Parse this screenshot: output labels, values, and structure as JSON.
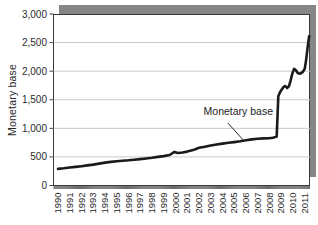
{
  "chart_data": {
    "type": "line",
    "title": "",
    "xlabel": "",
    "ylabel": "Monetary base",
    "ylim": [
      0,
      3000
    ],
    "xlim": [
      1989.62,
      2011.45
    ],
    "grid": "horizontal",
    "legend_position": "none",
    "y_ticks": [
      {
        "value": 0,
        "label": "0"
      },
      {
        "value": 500,
        "label": "500"
      },
      {
        "value": 1000,
        "label": "1,000"
      },
      {
        "value": 1500,
        "label": "1,500"
      },
      {
        "value": 2000,
        "label": "2,000"
      },
      {
        "value": 2500,
        "label": "2,500"
      },
      {
        "value": 3000,
        "label": "3,000"
      }
    ],
    "x_ticks": [
      {
        "value": 1990,
        "label": "1990"
      },
      {
        "value": 1991,
        "label": "1991"
      },
      {
        "value": 1992,
        "label": "1992"
      },
      {
        "value": 1993,
        "label": "1993"
      },
      {
        "value": 1994,
        "label": "1994"
      },
      {
        "value": 1995,
        "label": "1995"
      },
      {
        "value": 1996,
        "label": "1996"
      },
      {
        "value": 1997,
        "label": "1997"
      },
      {
        "value": 1998,
        "label": "1998"
      },
      {
        "value": 1999,
        "label": "1999"
      },
      {
        "value": 2000,
        "label": "2000"
      },
      {
        "value": 2001,
        "label": "2001"
      },
      {
        "value": 2002,
        "label": "2002"
      },
      {
        "value": 2003,
        "label": "2003"
      },
      {
        "value": 2004,
        "label": "2004"
      },
      {
        "value": 2005,
        "label": "2005"
      },
      {
        "value": 2006,
        "label": "2006"
      },
      {
        "value": 2007,
        "label": "2007"
      },
      {
        "value": 2008,
        "label": "2008"
      },
      {
        "value": 2009,
        "label": "2009"
      },
      {
        "value": 2010,
        "label": "2010"
      },
      {
        "value": 2011,
        "label": "2011"
      }
    ],
    "minor_x_tick_every_months": 1,
    "annotation": {
      "label": "Monetary base",
      "text_pos": {
        "year": 2005.35,
        "value": 1295
      },
      "leader_from": {
        "year": 2004.45,
        "value": 1095
      },
      "leader_to": {
        "year": 2005.75,
        "value": 800
      }
    },
    "series": [
      {
        "name": "Monetary base",
        "color": "#1a1a1a",
        "points": [
          [
            1990.0,
            290
          ],
          [
            1990.5,
            300
          ],
          [
            1991.0,
            315
          ],
          [
            1991.5,
            326
          ],
          [
            1992.0,
            338
          ],
          [
            1992.5,
            352
          ],
          [
            1993.0,
            366
          ],
          [
            1993.5,
            383
          ],
          [
            1994.0,
            400
          ],
          [
            1994.5,
            413
          ],
          [
            1995.0,
            425
          ],
          [
            1995.5,
            433
          ],
          [
            1996.0,
            441
          ],
          [
            1996.5,
            451
          ],
          [
            1997.0,
            461
          ],
          [
            1997.5,
            473
          ],
          [
            1998.0,
            485
          ],
          [
            1998.5,
            500
          ],
          [
            1999.0,
            514
          ],
          [
            1999.5,
            534
          ],
          [
            1999.92,
            588
          ],
          [
            2000.2,
            568
          ],
          [
            2000.6,
            577
          ],
          [
            2001.0,
            593
          ],
          [
            2001.5,
            620
          ],
          [
            2001.8,
            643
          ],
          [
            2002.0,
            659
          ],
          [
            2002.5,
            677
          ],
          [
            2003.0,
            698
          ],
          [
            2003.5,
            717
          ],
          [
            2004.0,
            733
          ],
          [
            2004.5,
            747
          ],
          [
            2005.0,
            760
          ],
          [
            2005.5,
            773
          ],
          [
            2006.0,
            790
          ],
          [
            2006.5,
            806
          ],
          [
            2007.0,
            817
          ],
          [
            2007.5,
            824
          ],
          [
            2008.0,
            830
          ],
          [
            2008.3,
            836
          ],
          [
            2008.62,
            855
          ],
          [
            2008.75,
            1560
          ],
          [
            2008.9,
            1630
          ],
          [
            2009.05,
            1680
          ],
          [
            2009.2,
            1725
          ],
          [
            2009.35,
            1740
          ],
          [
            2009.5,
            1705
          ],
          [
            2009.65,
            1735
          ],
          [
            2009.8,
            1835
          ],
          [
            2009.95,
            1965
          ],
          [
            2010.1,
            2040
          ],
          [
            2010.25,
            2015
          ],
          [
            2010.42,
            1962
          ],
          [
            2010.62,
            1958
          ],
          [
            2010.82,
            1982
          ],
          [
            2011.0,
            2040
          ],
          [
            2011.12,
            2190
          ],
          [
            2011.25,
            2430
          ],
          [
            2011.38,
            2615
          ]
        ]
      }
    ],
    "colors": {
      "line": "#1a1a1a",
      "shadow": "#868686",
      "grid": "#c9c9c9",
      "axis": "#3a3a3a",
      "tick": "#444444",
      "text": "#2b2b2b",
      "plot_bg": "#ffffff",
      "fig_bg": "#ffffff"
    }
  }
}
